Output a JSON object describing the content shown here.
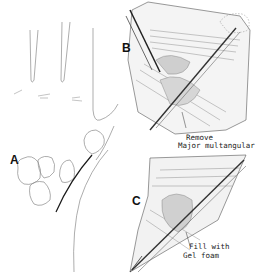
{
  "figure": {
    "panels": [
      {
        "label": "A",
        "description": "Dorsal hand outline with carpal bones and skin incision line"
      },
      {
        "label": "B",
        "description": "Surgical exposure with retractors showing removal of major multangular"
      },
      {
        "label": "C",
        "description": "Surgical exposure with defect filled with gel foam"
      }
    ],
    "annotations": {
      "b_line1": "Remove",
      "b_line2": "Major multangular",
      "c_line1": "Fill with",
      "c_line2": "Gel foam"
    },
    "colors": {
      "ink": "#1a1a1a",
      "outline": "#8a8a8a",
      "background": "#ffffff"
    }
  }
}
